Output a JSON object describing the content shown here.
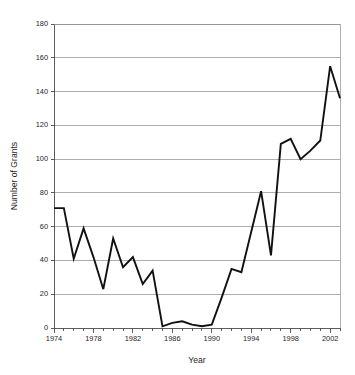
{
  "chart_data": {
    "type": "line",
    "title": "",
    "xlabel": "Year",
    "ylabel": "Number of Grants",
    "xlim": [
      1974,
      2003
    ],
    "ylim": [
      0,
      180
    ],
    "grid": true,
    "legend_position": "none",
    "x_tick_labels": [
      "1974",
      "1978",
      "1982",
      "1986",
      "1990",
      "1994",
      "1998",
      "2002"
    ],
    "x_tick_values": [
      1974,
      1978,
      1982,
      1986,
      1990,
      1994,
      1998,
      2002
    ],
    "x_minor_tick_step": 1,
    "y_tick_labels": [
      "0",
      "20",
      "40",
      "60",
      "80",
      "100",
      "120",
      "140",
      "160",
      "180"
    ],
    "y_tick_values": [
      0,
      20,
      40,
      60,
      80,
      100,
      120,
      140,
      160,
      180
    ],
    "series": [
      {
        "name": "Number of Grants",
        "color": "#111111",
        "x": [
          1974,
          1975,
          1976,
          1977,
          1978,
          1979,
          1980,
          1981,
          1982,
          1983,
          1984,
          1985,
          1986,
          1987,
          1988,
          1989,
          1990,
          1991,
          1992,
          1993,
          1994,
          1995,
          1996,
          1997,
          1998,
          1999,
          2000,
          2001,
          2002,
          2003
        ],
        "values": [
          71,
          71,
          41,
          59,
          42,
          23,
          53,
          36,
          42,
          26,
          34,
          1,
          3,
          4,
          2,
          1,
          2,
          18,
          35,
          33,
          57,
          81,
          43,
          109,
          112,
          100,
          105,
          111,
          155,
          136
        ]
      }
    ]
  }
}
